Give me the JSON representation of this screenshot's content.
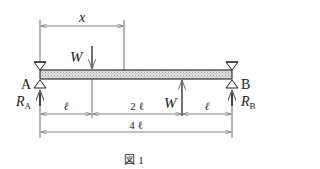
{
  "diagram": {
    "type": "simply-supported-beam",
    "labels": {
      "x": "x",
      "load_top": "W",
      "load_bottom": "W",
      "support_left": "A",
      "support_right": "B",
      "reaction_left": "R",
      "reaction_left_sub": "A",
      "reaction_right": "R",
      "reaction_right_sub": "B"
    },
    "dimensions": {
      "seg1": "ℓ",
      "seg2": "2 ℓ",
      "seg3": "ℓ",
      "total": "4 ℓ"
    },
    "caption": "図 1"
  }
}
